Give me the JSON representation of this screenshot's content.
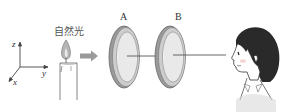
{
  "diagram": {
    "light_label": "自然光",
    "axes": {
      "z": "z",
      "y": "y",
      "x": "x"
    },
    "polarizers": [
      {
        "label": "A"
      },
      {
        "label": "B"
      }
    ],
    "colors": {
      "line": "#555555",
      "arrow": "#9a9a9a",
      "flame": "#a9a9a9",
      "frame_outer": "#8a8a8a",
      "frame_inner": "#cfcfcf",
      "hair": "#2a2a2a",
      "cheek": "#f2c9c9"
    }
  }
}
